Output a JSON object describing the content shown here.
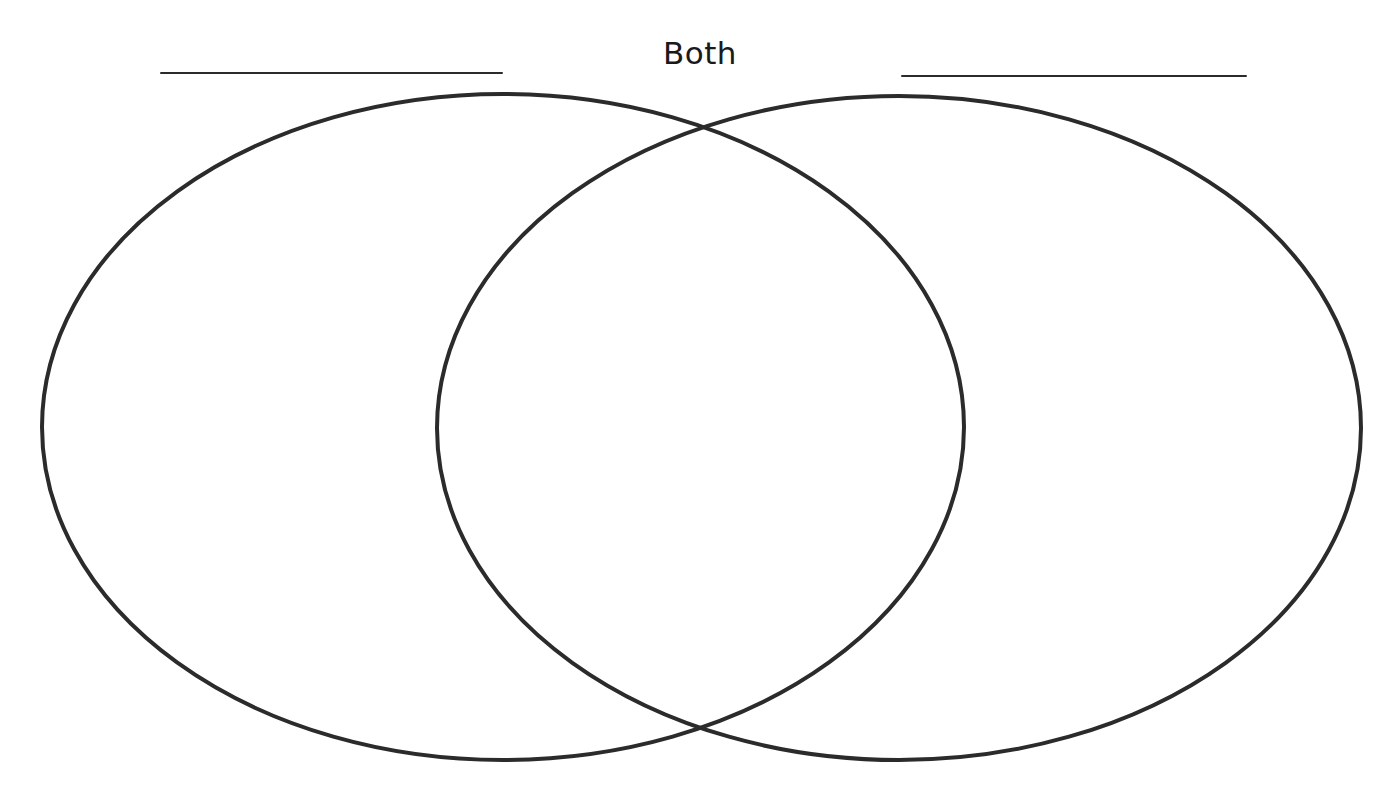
{
  "diagram": {
    "type": "venn",
    "sets": 2,
    "center_label": "Both",
    "left_set": {
      "label": "",
      "label_line": {
        "x1": 161,
        "y1": 73,
        "x2": 502,
        "y2": 73
      },
      "ellipse": {
        "cx": 503,
        "cy": 427,
        "rx": 461,
        "ry": 333
      }
    },
    "right_set": {
      "label": "",
      "label_line": {
        "x1": 902,
        "y1": 76,
        "x2": 1246,
        "y2": 76
      },
      "ellipse": {
        "cx": 899,
        "cy": 428,
        "rx": 462,
        "ry": 332
      }
    },
    "colors": {
      "background": "#ffffff",
      "stroke": "#2b2b2b",
      "text": "#1a1a1a"
    }
  }
}
